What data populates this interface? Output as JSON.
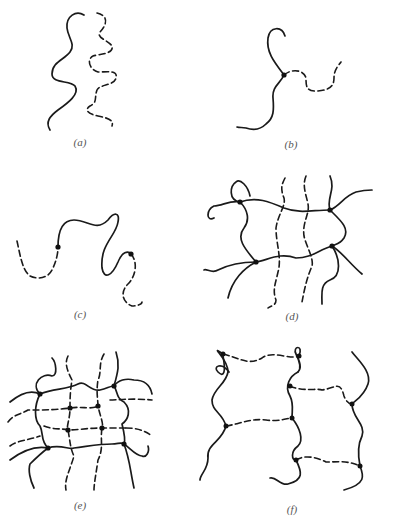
{
  "figure": {
    "legend": {
      "solid_line": "polymer chain (type 1)",
      "dashed_line": "polymer chain (type 2)",
      "dot": "junction / crosslink point"
    },
    "panels": [
      {
        "id": "a",
        "label": "(a)",
        "x": 80,
        "y": 136
      },
      {
        "id": "b",
        "label": "(b)",
        "x": 291,
        "y": 138
      },
      {
        "id": "c",
        "label": "(c)",
        "x": 80,
        "y": 308
      },
      {
        "id": "d",
        "label": "(d)",
        "x": 292,
        "y": 310
      },
      {
        "id": "e",
        "label": "(e)",
        "x": 80,
        "y": 499
      },
      {
        "id": "f",
        "label": "(f)",
        "x": 292,
        "y": 503
      }
    ]
  }
}
